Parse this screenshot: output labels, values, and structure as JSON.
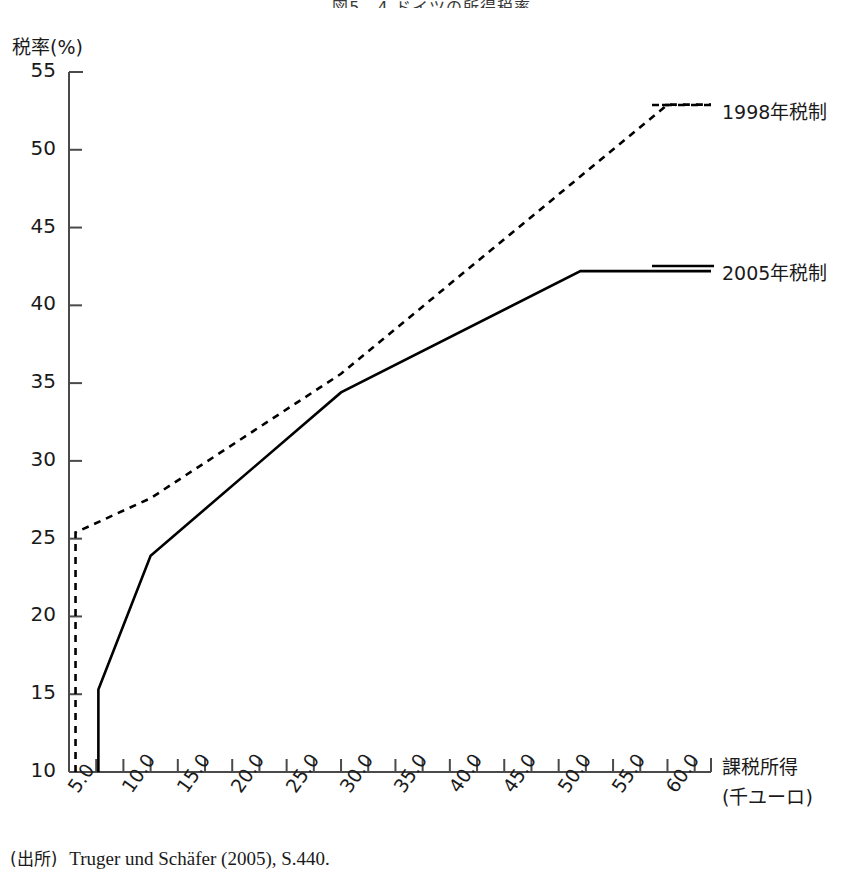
{
  "title": "図5―4 ドイツの所得税率",
  "source": {
    "prefix": "(出所)",
    "text": "Truger und Schäfer (2005), S.440."
  },
  "axes": {
    "ylabel": "税率(%)",
    "xlabel_line1": "課税所得",
    "xlabel_line2": "(千ユーロ)"
  },
  "legend": [
    {
      "label": "1998年税制",
      "style": "dashed",
      "color": "#000000"
    },
    {
      "label": "2005年税制",
      "style": "solid",
      "color": "#000000"
    }
  ],
  "chart_data": {
    "type": "line",
    "title": "図5―4 ドイツの所得税率",
    "xlabel": "課税所得(千ユーロ)",
    "ylabel": "税率(%)",
    "xlim": [
      5.0,
      64.0
    ],
    "ylim": [
      10,
      55
    ],
    "grid": false,
    "legend_position": "right",
    "xticks": [
      "5.0",
      "10.0",
      "15.0",
      "20.0",
      "25.0",
      "30.0",
      "35.0",
      "40.0",
      "45.0",
      "50.0",
      "55.0",
      "60.0"
    ],
    "xtick_values": [
      5.0,
      10.0,
      15.0,
      20.0,
      25.0,
      30.0,
      35.0,
      40.0,
      45.0,
      50.0,
      55.0,
      60.0
    ],
    "xminor_step": 2.5,
    "yticks": [
      "10",
      "15",
      "20",
      "25",
      "30",
      "35",
      "40",
      "45",
      "50",
      "55"
    ],
    "ytick_values": [
      10,
      15,
      20,
      25,
      30,
      35,
      40,
      45,
      50,
      55
    ],
    "series": [
      {
        "name": "1998年税制",
        "style": "dashed",
        "color": "#000000",
        "x": [
          5.6,
          5.6,
          12.5,
          30.0,
          60.0,
          64.0
        ],
        "y": [
          10.0,
          25.4,
          27.6,
          35.6,
          52.9,
          52.9
        ]
      },
      {
        "name": "2005年税制",
        "style": "solid",
        "color": "#000000",
        "x": [
          7.7,
          7.7,
          12.5,
          30.0,
          52.0,
          64.0
        ],
        "y": [
          10.0,
          15.3,
          23.9,
          34.4,
          42.2,
          42.2
        ]
      }
    ]
  }
}
